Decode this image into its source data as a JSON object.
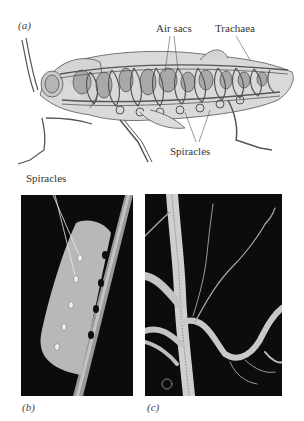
{
  "figure": {
    "panels": [
      {
        "id": "a",
        "tag": "(a)",
        "kind": "illustration",
        "subject": "insect (grasshopper) tracheal system cutaway"
      },
      {
        "id": "b",
        "tag": "(b)",
        "kind": "photograph",
        "subject": "caterpillar on stem showing spiracles"
      },
      {
        "id": "c",
        "tag": "(c)",
        "kind": "photograph",
        "subject": "branching tracheal tubes"
      }
    ],
    "labels": {
      "air_sacs": "Air sacs",
      "trachaea": "Trachaea",
      "spiracles_a": "Spiracles",
      "spiracles_b": "Spiracles"
    }
  },
  "colors": {
    "background": "#ffffff",
    "body_fill": "#d9d9d9",
    "air_sac_fill": "#a9a9a9",
    "outline": "#555555",
    "photo_bg": "#0c0c0c",
    "caterpillar": "#b8b8b8",
    "trachea_tube": "#cfcfcf"
  }
}
